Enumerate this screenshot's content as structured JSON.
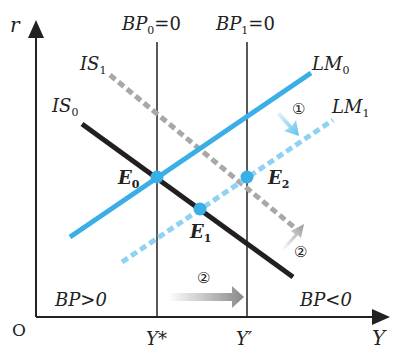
{
  "title_partial": "",
  "axes": {
    "y_label": "r",
    "x_label": "Y",
    "origin": "O",
    "x_ticks": [
      "Y*",
      "Y′"
    ]
  },
  "curves": {
    "bp0": {
      "name": "BP",
      "sub": "0",
      "eq": "=0"
    },
    "bp1": {
      "name": "BP",
      "sub": "1",
      "eq": "=0"
    },
    "is0": {
      "name": "IS",
      "sub": "0"
    },
    "is1": {
      "name": "IS",
      "sub": "1"
    },
    "lm0": {
      "name": "LM",
      "sub": "0"
    },
    "lm1": {
      "name": "LM",
      "sub": "1"
    }
  },
  "points": {
    "e0": {
      "name": "E",
      "sub": "0"
    },
    "e1": {
      "name": "E",
      "sub": "1"
    },
    "e2": {
      "name": "E",
      "sub": "2"
    }
  },
  "regions": {
    "left": "BP>0",
    "right": "BP<0"
  },
  "step_markers": {
    "lm_shift": "①",
    "is_shift": "②",
    "bp_shift": "②"
  },
  "colors": {
    "lm0": "#3aaee6",
    "lm1": "#8fd3f2",
    "is0": "#231f20",
    "is1": "#a8a8a8",
    "point": "#3aaee6",
    "axis": "#222222"
  }
}
